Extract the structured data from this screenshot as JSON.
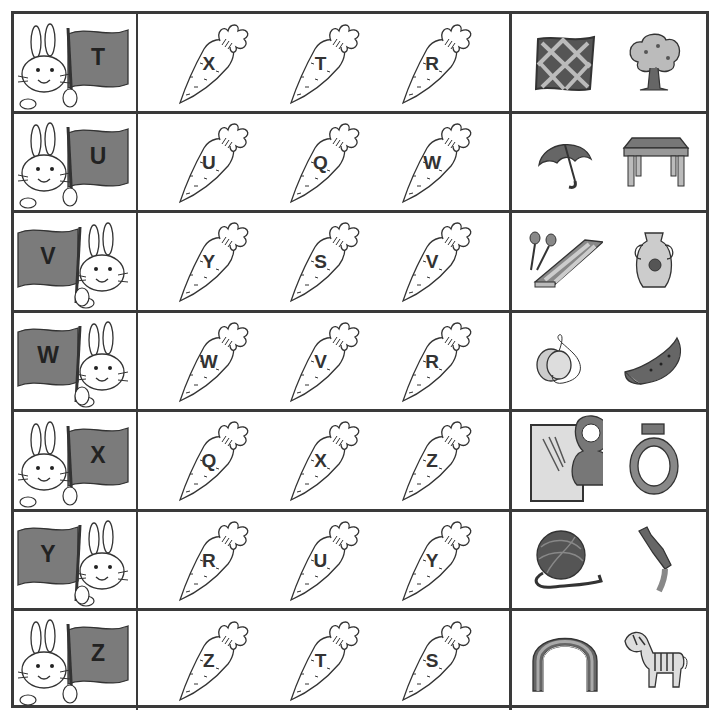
{
  "worksheet": {
    "rows": [
      {
        "flag_letter": "T",
        "flag_side": "right",
        "carrots": [
          "X",
          "T",
          "R"
        ],
        "pictures": [
          "quilt",
          "tree"
        ]
      },
      {
        "flag_letter": "U",
        "flag_side": "right",
        "carrots": [
          "U",
          "Q",
          "W"
        ],
        "pictures": [
          "umbrella",
          "table"
        ]
      },
      {
        "flag_letter": "V",
        "flag_side": "left",
        "carrots": [
          "Y",
          "S",
          "V"
        ],
        "pictures": [
          "xylophone",
          "vase"
        ]
      },
      {
        "flag_letter": "W",
        "flag_side": "left",
        "carrots": [
          "W",
          "V",
          "R"
        ],
        "pictures": [
          "yo-yo",
          "watermelon"
        ]
      },
      {
        "flag_letter": "X",
        "flag_side": "right",
        "carrots": [
          "Q",
          "X",
          "Z"
        ],
        "pictures": [
          "x-ray",
          "ring"
        ]
      },
      {
        "flag_letter": "Y",
        "flag_side": "left",
        "carrots": [
          "R",
          "U",
          "Y"
        ],
        "pictures": [
          "yarn",
          "zipper"
        ]
      },
      {
        "flag_letter": "Z",
        "flag_side": "right",
        "carrots": [
          "Z",
          "T",
          "S"
        ],
        "pictures": [
          "rainbow",
          "zebra"
        ]
      }
    ]
  },
  "colors": {
    "flag": "#7b7b7b",
    "lines": "#3a3a3a",
    "ink": "#222222"
  }
}
